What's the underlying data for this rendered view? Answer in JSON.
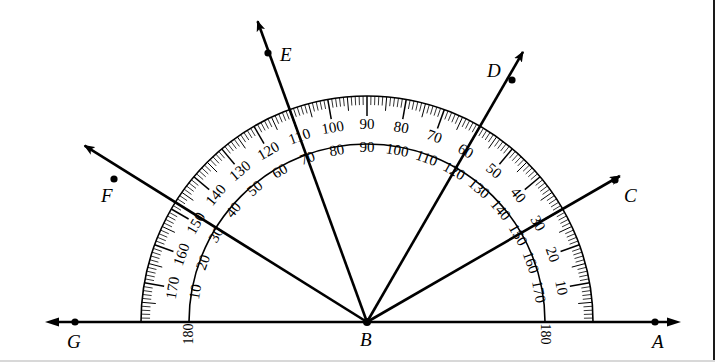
{
  "figure": {
    "type": "protractor-diagram",
    "background": "#ffffff",
    "ink": "#000000",
    "center": {
      "x": 367,
      "y": 322,
      "label": "B"
    },
    "baseline": {
      "y": 322,
      "x_left": 45,
      "x_right": 681,
      "left_arrow": true,
      "right_arrow": true
    },
    "protractor": {
      "outer_radius": 226,
      "inner_radius": 178,
      "tick_band_inner_radius": 206,
      "major_tick_length": 20,
      "mid_tick_length": 14,
      "minor_tick_length": 9,
      "outer_scale_label_radius": 196,
      "inner_scale_label_radius": 186,
      "outer_scale_direction": "counterclockwise-from-right",
      "outer_scale_labels": [
        "10",
        "20",
        "30",
        "40",
        "50",
        "60",
        "70",
        "80",
        "90",
        "100",
        "110",
        "120",
        "130",
        "140",
        "150",
        "160",
        "170",
        "180"
      ],
      "inner_scale_labels": [
        "170",
        "160",
        "150",
        "140",
        "130",
        "120",
        "110",
        "100",
        "90",
        "80",
        "70",
        "60",
        "50",
        "40",
        "30",
        "20",
        "10",
        "180"
      ],
      "end_labels": {
        "left": "180",
        "right": "180"
      },
      "tick_step_degrees": 1,
      "major_step_degrees": 10,
      "mid_step_degrees": 5
    },
    "points": [
      {
        "name": "A",
        "label": "A",
        "x": 655,
        "y": 322,
        "label_x": 652,
        "label_y": 332,
        "dot": true
      },
      {
        "name": "B",
        "label": "B",
        "x": 367,
        "y": 322,
        "label_x": 360,
        "label_y": 330,
        "dot": true
      },
      {
        "name": "C",
        "label": "C",
        "x": 615,
        "y": 180,
        "label_x": 624,
        "label_y": 186,
        "dot": true
      },
      {
        "name": "D",
        "label": "D",
        "x": 512,
        "y": 80,
        "label_x": 487,
        "label_y": 61,
        "dot": true
      },
      {
        "name": "E",
        "label": "E",
        "x": 268,
        "y": 53,
        "label_x": 280,
        "label_y": 45,
        "dot": true
      },
      {
        "name": "F",
        "label": "F",
        "x": 114,
        "y": 179,
        "label_x": 101,
        "label_y": 186,
        "dot": true
      },
      {
        "name": "G",
        "label": "G",
        "x": 75,
        "y": 322,
        "label_x": 67,
        "label_y": 332,
        "dot": true
      }
    ],
    "rays": [
      {
        "name": "BA",
        "label": "A",
        "angle_deg": 0,
        "length": 314,
        "arrow": true,
        "reads_outer": "180",
        "reads_inner": "0"
      },
      {
        "name": "BC",
        "label": "C",
        "angle_deg": 30,
        "length": 292,
        "arrow": true,
        "reads_outer": "30",
        "reads_inner": "150"
      },
      {
        "name": "BD",
        "label": "D",
        "angle_deg": 60,
        "length": 312,
        "arrow": true,
        "reads_outer": "60",
        "reads_inner": "120"
      },
      {
        "name": "BE",
        "label": "E",
        "angle_deg": 110,
        "length": 320,
        "arrow": true,
        "reads_outer": "110",
        "reads_inner": "70"
      },
      {
        "name": "BF",
        "label": "F",
        "angle_deg": 148,
        "length": 333,
        "arrow": true,
        "reads_outer": "150",
        "reads_inner": "30"
      },
      {
        "name": "BG",
        "label": "G",
        "angle_deg": 180,
        "length": 322,
        "arrow": true,
        "reads_outer": "0",
        "reads_inner": "180"
      }
    ]
  }
}
